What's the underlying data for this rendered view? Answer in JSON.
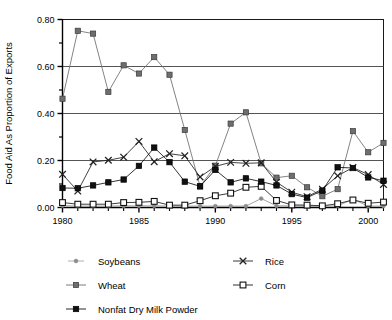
{
  "chart_data": {
    "type": "line",
    "title": "",
    "xlabel": "",
    "ylabel": "Food Aid As Proportion of Exports",
    "xlim": [
      1980,
      2001
    ],
    "ylim": [
      0.0,
      0.8
    ],
    "grid": "horizontal-major",
    "legend_position": "below",
    "y_ticks": [
      "0.00",
      "0.20",
      "0.40",
      "0.60",
      "0.80"
    ],
    "y_tick_values": [
      0.0,
      0.2,
      0.4,
      0.6,
      0.8
    ],
    "y_minor_tick_values": [
      0.1,
      0.3,
      0.5,
      0.7
    ],
    "x_ticks": [
      "1980",
      "1985",
      "1990",
      "1995",
      "2000"
    ],
    "x_tick_values": [
      1980,
      1985,
      1990,
      1995,
      2000
    ],
    "x_all_tick_values": [
      1980,
      1981,
      1982,
      1983,
      1984,
      1985,
      1986,
      1987,
      1988,
      1989,
      1990,
      1991,
      1992,
      1993,
      1994,
      1995,
      1996,
      1997,
      1998,
      1999,
      2000,
      2001
    ],
    "x": [
      1980,
      1981,
      1982,
      1983,
      1984,
      1985,
      1986,
      1987,
      1988,
      1989,
      1990,
      1991,
      1992,
      1993,
      1994,
      1995,
      1996,
      1997,
      1998,
      1999,
      2000,
      2001
    ],
    "series": [
      {
        "name": "Soybeans",
        "marker": "circle-small-gray",
        "color": "#8c8c8c",
        "values": [
          0.008,
          0.006,
          0.006,
          0.006,
          0.007,
          0.007,
          0.007,
          0.006,
          0.006,
          0.006,
          0.006,
          0.006,
          0.006,
          0.038,
          0.007,
          0.007,
          0.006,
          0.006,
          0.007,
          0.035,
          0.006,
          0.006
        ]
      },
      {
        "name": "Wheat",
        "marker": "square-filled-gray",
        "color": "#6e6e6e",
        "values": [
          0.463,
          0.752,
          0.74,
          0.492,
          0.605,
          0.57,
          0.64,
          0.565,
          0.33,
          0.09,
          0.178,
          0.357,
          0.405,
          0.188,
          0.127,
          0.135,
          0.086,
          0.048,
          0.078,
          0.325,
          0.235,
          0.275
        ]
      },
      {
        "name": "Nonfat Dry Milk Powder",
        "marker": "square-filled-black",
        "color": "#111111",
        "values": [
          0.083,
          0.082,
          0.094,
          0.107,
          0.119,
          0.177,
          0.255,
          0.193,
          0.11,
          0.09,
          0.16,
          0.107,
          0.124,
          0.11,
          0.094,
          0.057,
          0.042,
          0.072,
          0.171,
          0.168,
          0.128,
          0.114
        ]
      },
      {
        "name": "Rice",
        "marker": "x-cross",
        "color": "#222222",
        "values": [
          0.141,
          0.07,
          0.194,
          0.201,
          0.214,
          0.281,
          0.195,
          0.229,
          0.22,
          0.13,
          0.175,
          0.192,
          0.188,
          0.19,
          0.108,
          0.065,
          0.046,
          0.078,
          0.135,
          0.17,
          0.14,
          0.098
        ]
      },
      {
        "name": "Corn",
        "marker": "square-open",
        "color": "#1a1a1a",
        "values": [
          0.021,
          0.014,
          0.014,
          0.014,
          0.021,
          0.022,
          0.026,
          0.01,
          0.01,
          0.029,
          0.05,
          0.061,
          0.086,
          0.09,
          0.03,
          0.011,
          0.01,
          0.007,
          0.016,
          0.032,
          0.018,
          0.023
        ]
      }
    ],
    "legend_entries": [
      {
        "label": "Soybeans",
        "marker": "circle-small-gray"
      },
      {
        "label": "Rice",
        "marker": "x-cross"
      },
      {
        "label": "Wheat",
        "marker": "square-filled-gray"
      },
      {
        "label": "Corn",
        "marker": "square-open"
      },
      {
        "label": "Nonfat Dry Milk Powder",
        "marker": "square-filled-black"
      }
    ],
    "colors": {
      "soybeans": "#8c8c8c",
      "wheat": "#6e6e6e",
      "nonfat_dry_milk_powder": "#111111",
      "rice": "#222222",
      "corn": "#1a1a1a",
      "axis": "#000000",
      "gridline": "#555555",
      "background": "#ffffff"
    }
  }
}
